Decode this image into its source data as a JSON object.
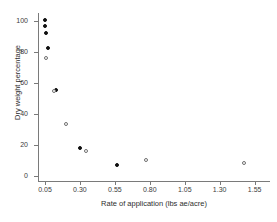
{
  "chart_data": {
    "type": "scatter",
    "title": "",
    "xlabel": "Rate of application (lbs ae/acre)",
    "ylabel": "Dry weight percentage",
    "xlim": [
      0.0,
      1.66
    ],
    "ylim": [
      -3,
      105
    ],
    "xticks": [
      0.05,
      0.3,
      0.55,
      0.8,
      1.05,
      1.3,
      1.55
    ],
    "xticklabels": [
      "0.05",
      "0.30",
      "0.55",
      "0.80",
      "1.05",
      "1.30",
      "1.55"
    ],
    "yticks": [
      0,
      20,
      40,
      60,
      80,
      100
    ],
    "yticklabels": [
      "0",
      "20",
      "40",
      "60",
      "80",
      "100"
    ],
    "grid": false,
    "legend": "none",
    "series": [
      {
        "name": "filled",
        "marker": "filled-circle",
        "color": "#101010",
        "points": [
          {
            "x": 0.048,
            "y": 100.5
          },
          {
            "x": 0.053,
            "y": 96.5
          },
          {
            "x": 0.058,
            "y": 92.0
          },
          {
            "x": 0.072,
            "y": 82.5
          },
          {
            "x": 0.132,
            "y": 55.8
          },
          {
            "x": 0.3,
            "y": 18.4
          },
          {
            "x": 0.565,
            "y": 7.2
          }
        ]
      },
      {
        "name": "open",
        "marker": "open-circle",
        "color": "#6f6f6f",
        "points": [
          {
            "x": 0.057,
            "y": 76.0
          },
          {
            "x": 0.118,
            "y": 55.0
          },
          {
            "x": 0.2,
            "y": 33.8
          },
          {
            "x": 0.34,
            "y": 16.5
          },
          {
            "x": 0.775,
            "y": 10.8
          },
          {
            "x": 1.475,
            "y": 8.4
          }
        ]
      }
    ]
  }
}
